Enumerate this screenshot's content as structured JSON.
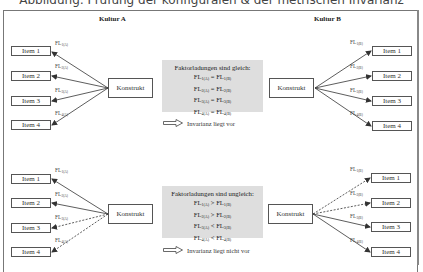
{
  "title": "Abbildung: Prüfung der konfiguralen & der metrischen Invarianz",
  "columns": {
    "left": "Kultur A",
    "right": "Kultur B"
  },
  "construct_label": "Konstrukt",
  "items": [
    "Item 1",
    "Item 2",
    "Item 3",
    "Item 4"
  ],
  "fl_prefix": "FL",
  "loadings_a": [
    "1(A)",
    "2(A)",
    "3(A)",
    "4(A)"
  ],
  "loadings_b": [
    "1(B)",
    "2(B)",
    "3(B)",
    "4(B)"
  ],
  "panels": [
    {
      "header": "Faktorladungen sind gleich:",
      "operators": [
        "=",
        "=",
        "=",
        "="
      ],
      "conclusion": "Invarianz liegt vor",
      "left_line_styles": [
        "solid",
        "solid",
        "solid",
        "solid"
      ],
      "right_line_styles": [
        "solid",
        "solid",
        "solid",
        "solid"
      ]
    },
    {
      "header": "Faktorladungen sind ungleich:",
      "operators": [
        ">",
        ">",
        "<",
        "<"
      ],
      "conclusion": "Invarianz liegt nicht vor",
      "left_line_styles": [
        "solid",
        "solid",
        "dashed",
        "dashed"
      ],
      "right_line_styles": [
        "dashed",
        "dashed",
        "solid",
        "solid"
      ]
    }
  ],
  "colors": {
    "summary_box": "#dedede",
    "lines": "#333333",
    "frame": "#777777"
  }
}
